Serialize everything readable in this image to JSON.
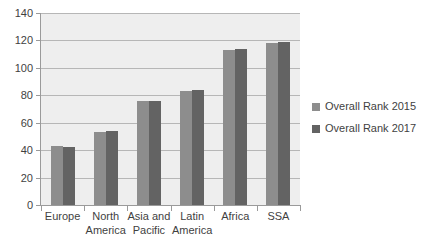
{
  "chart_data": {
    "type": "bar",
    "title": "",
    "subtitle": "",
    "xlabel": "",
    "ylabel": "",
    "ylim": [
      0,
      140
    ],
    "ytick_step": 20,
    "yticks": [
      "0",
      "20",
      "40",
      "60",
      "80",
      "100",
      "120",
      "140"
    ],
    "grid": true,
    "legend_position": "right",
    "categories": [
      "Europe",
      "North\nAmerica",
      "Asia and\nPacific",
      "Latin\nAmerica",
      "Africa",
      "SSA"
    ],
    "series": [
      {
        "name": "Overall Rank 2015",
        "color": "#8d8d8d",
        "values": [
          43,
          53,
          76,
          83,
          113,
          118
        ]
      },
      {
        "name": "Overall Rank 2017",
        "color": "#636363",
        "values": [
          42,
          54,
          76,
          84,
          114,
          119
        ]
      }
    ]
  },
  "legend": {
    "entries": [
      {
        "label": "Overall Rank 2015",
        "color": "#8d8d8d"
      },
      {
        "label": "Overall Rank 2017",
        "color": "#636363"
      }
    ]
  },
  "colors": {
    "plot_background": "#eeeeee",
    "gridline": "#b6b6b6",
    "axis": "#9a9a9a",
    "text": "#3f3f3f",
    "series_2015": "#8d8d8d",
    "series_2017": "#636363"
  }
}
